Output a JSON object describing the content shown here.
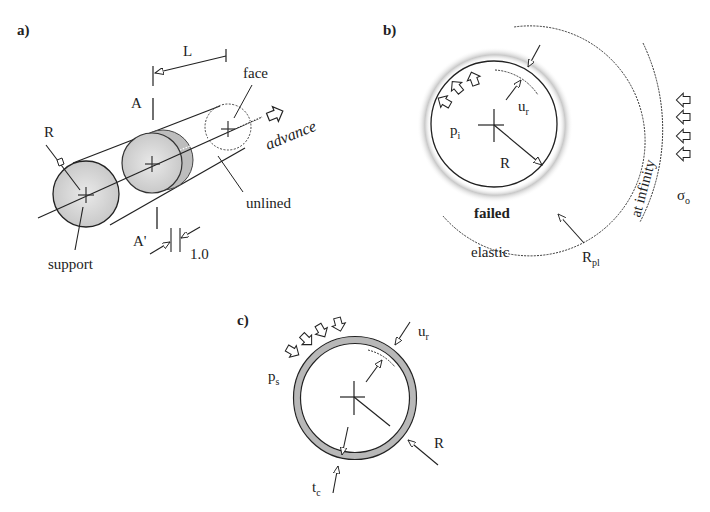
{
  "figure": {
    "panel_a": {
      "tag": "a)",
      "labels": {
        "L": "L",
        "A": "A",
        "A_prime": "A'",
        "R": "R",
        "face": "face",
        "advance": "advance",
        "unlined": "unlined",
        "support": "support",
        "unit_width": "1.0"
      }
    },
    "panel_b": {
      "tag": "b)",
      "labels": {
        "u": "u",
        "u_sub": "r",
        "p": "p",
        "p_sub": "i",
        "R": "R",
        "failed": "failed",
        "elastic": "elastic",
        "Rpl": "R",
        "Rpl_sub": "pl",
        "at_infinity": "at infinity",
        "sigma": "σ",
        "sigma_sub": "o"
      }
    },
    "panel_c": {
      "tag": "c)",
      "labels": {
        "u": "u",
        "u_sub": "r",
        "p": "p",
        "p_sub": "s",
        "R": "R",
        "t": "t",
        "t_sub": "c"
      }
    }
  },
  "colors": {
    "line": "#222222",
    "shade": "#c8c8c8",
    "ring": "#b5b5b5"
  }
}
